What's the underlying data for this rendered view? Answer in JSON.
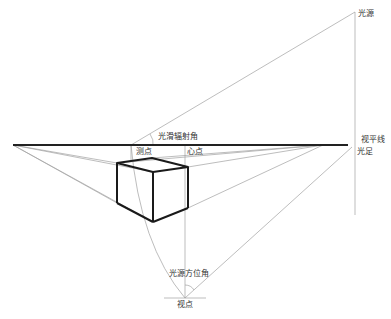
{
  "diagram": {
    "title": "",
    "labels": {
      "light_source": "光源",
      "horizon_line": "视平线",
      "light_foot": "光足",
      "light_elevation_angle": "光滑辐射角",
      "measuring_point": "测点",
      "center_point": "心点",
      "light_azimuth_angle": "光源方位角",
      "viewpoint": "视点"
    },
    "colors": {
      "horizon": "#222222",
      "construction": "#9a9a9a",
      "cube": "#1a1a1a"
    }
  }
}
